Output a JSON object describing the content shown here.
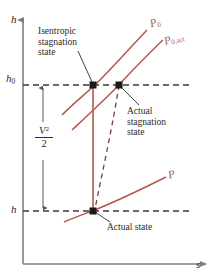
{
  "figure": {
    "type": "h-s thermodynamic state diagram",
    "title": "",
    "background_color": "#ffffff",
    "curve_color": "#b5564a",
    "axis_color": "#808080",
    "text_color": "#2b2b2b"
  },
  "axes": {
    "y_label": "h",
    "x_label": "s",
    "y_tick_labels": [
      {
        "text": "h",
        "subscript": "0",
        "value_y": 78
      },
      {
        "text": "h",
        "subscript": "",
        "value_y": 211
      }
    ]
  },
  "curves": [
    {
      "name": "isentropic-stagnation-pressure-curve",
      "label": "P",
      "subscript": "0",
      "label_x": 152,
      "label_y": 22
    },
    {
      "name": "actual-stagnation-pressure-curve",
      "label": "P",
      "subscript": "0,act",
      "label_x": 168,
      "label_y": 38
    },
    {
      "name": "static-pressure-curve",
      "label": "P",
      "subscript": "",
      "label_x": 170,
      "label_y": 176
    }
  ],
  "annotations": [
    {
      "name": "isentropic-stagnation-state-label",
      "lines": [
        "Isentropic",
        "stagnation",
        "state"
      ],
      "x": 38,
      "y": 28
    },
    {
      "name": "actual-stagnation-state-label",
      "lines": [
        "Actual",
        "stagnation",
        "state"
      ],
      "x": 127,
      "y": 108
    },
    {
      "name": "actual-state-label",
      "lines": [
        "Actual state"
      ],
      "x": 106,
      "y": 224
    }
  ],
  "kinetic_energy_label": {
    "name": "kinetic-energy-term",
    "numerator": "V",
    "exponent": "2",
    "denominator": "2",
    "x": 44,
    "y": 128
  },
  "state_points": [
    {
      "name": "isentropic-stagnation-state-point",
      "x": 93,
      "y": 85
    },
    {
      "name": "actual-stagnation-state-point",
      "x": 119,
      "y": 85
    },
    {
      "name": "actual-state-point",
      "x": 93,
      "y": 211
    }
  ]
}
